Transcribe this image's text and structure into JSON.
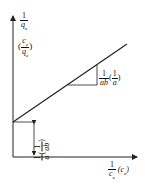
{
  "diagram": {
    "y_axis": {
      "label_primary_num": "1",
      "label_primary_den": "q",
      "label_primary_sub": "e",
      "label_alt_num": "c",
      "label_alt_num_sub": "e",
      "label_alt_den": "q",
      "label_alt_den_sub": "e"
    },
    "x_axis": {
      "label_num": "1",
      "label_den": "c",
      "label_den_sub": "e",
      "label_alt": "(c",
      "label_alt_sub": "e",
      "label_alt_close": ")"
    },
    "slope": {
      "num": "1",
      "den": "ab",
      "alt_num": "1",
      "alt_den": "a"
    },
    "intercept": {
      "num": "1",
      "den": "a",
      "alt_num": "1",
      "alt_den": "ab"
    },
    "colors": {
      "line": "#222222",
      "background": "#ffffff"
    }
  }
}
